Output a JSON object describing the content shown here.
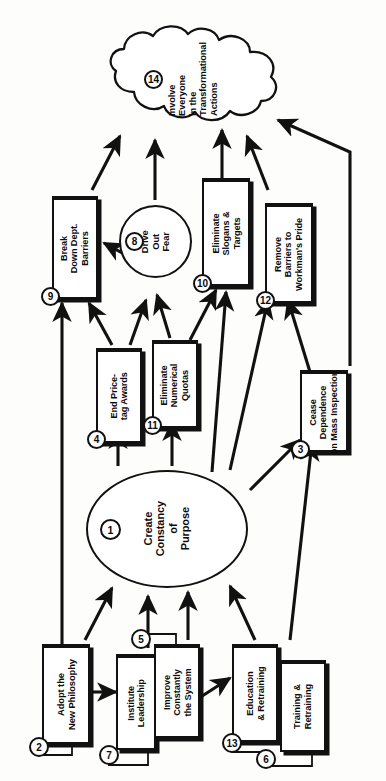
{
  "diagram": {
    "type": "flowchart",
    "orientation": "rotated-90-ccw",
    "colors": {
      "stroke": "#111111",
      "fill": "#ffffff",
      "background": "#fdfdfc",
      "text": "#0b0b0b"
    }
  },
  "nodes": {
    "n14": {
      "number": "14",
      "label": "Involve\nEveryone\nin the\nTransformational\nActions",
      "shape": "cloud"
    },
    "n9": {
      "number": "9",
      "label": "Break\nDown Dept.\nBarriers",
      "shape": "box"
    },
    "n8": {
      "number": "8",
      "label": "Drive\nOut\nFear",
      "shape": "circle"
    },
    "n10": {
      "number": "10",
      "label": "Eliminate\nSlogans &\nTargets",
      "shape": "box"
    },
    "n12": {
      "number": "12",
      "label": "Remove\nBarriers to\nWorkman's Pride",
      "shape": "box"
    },
    "n4": {
      "number": "4",
      "label": "End Price-\ntag Awards",
      "shape": "box"
    },
    "n11": {
      "number": "11",
      "label": "Eliminate\nNumerical\nQuotas",
      "shape": "box"
    },
    "n3": {
      "number": "3",
      "label": "Cease\nDependence\non Mass Inspection",
      "shape": "box"
    },
    "n1": {
      "number": "1",
      "label": "Create\nConstancy\nof\nPurpose",
      "shape": "ellipse"
    },
    "n2": {
      "number": "2",
      "label": "Adopt the\nNew Philosophy",
      "shape": "box"
    },
    "n7": {
      "number": "7",
      "label": "Institute\nLeadership",
      "shape": "box"
    },
    "n5": {
      "number": "5",
      "label": "Improve\nConstantly\nthe System",
      "shape": "box"
    },
    "n13": {
      "number": "13",
      "label": "Education\n& Retraining",
      "shape": "box"
    },
    "n6": {
      "number": "6",
      "label": "Training &\nRetraining",
      "shape": "box"
    }
  },
  "edges": [
    {
      "from": "n9",
      "to": "n14"
    },
    {
      "from": "n8",
      "to": "n14"
    },
    {
      "from": "n10",
      "to": "n14"
    },
    {
      "from": "n12",
      "to": "n14"
    },
    {
      "from": "n3",
      "to": "n14"
    },
    {
      "from": "n8",
      "to": "n9"
    },
    {
      "from": "n4",
      "to": "n9"
    },
    {
      "from": "n2",
      "to": "n9"
    },
    {
      "from": "n4",
      "to": "n8"
    },
    {
      "from": "n11",
      "to": "n8"
    },
    {
      "from": "n11",
      "to": "n10"
    },
    {
      "from": "n1",
      "to": "n10"
    },
    {
      "from": "n3",
      "to": "n12"
    },
    {
      "from": "n1",
      "to": "n12"
    },
    {
      "from": "n1",
      "to": "n4"
    },
    {
      "from": "n1",
      "to": "n11"
    },
    {
      "from": "n1",
      "to": "n3"
    },
    {
      "from": "n6",
      "to": "n3"
    },
    {
      "from": "n2",
      "to": "n1"
    },
    {
      "from": "n7",
      "to": "n1"
    },
    {
      "from": "n5",
      "to": "n1"
    },
    {
      "from": "n13",
      "to": "n1"
    },
    {
      "from": "n6",
      "to": "n1"
    },
    {
      "from": "n2",
      "to": "n7"
    },
    {
      "from": "n5",
      "to": "n13"
    }
  ]
}
